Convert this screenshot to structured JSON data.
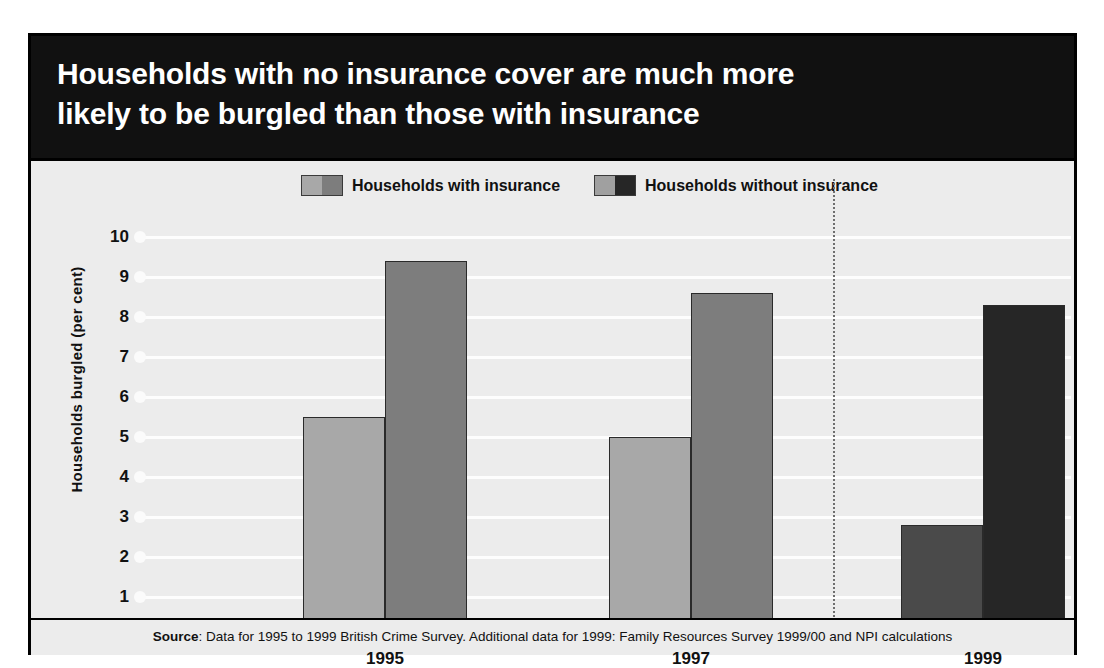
{
  "title": "Households with no insurance cover are much more\nlikely to be burgled than those with insurance",
  "legend": [
    {
      "label": "Households with insurance",
      "swatch_light": "#a8a8a8",
      "swatch_dark": "#7d7d7d"
    },
    {
      "label": "Households without insurance",
      "swatch_light": "#a0a0a0",
      "swatch_dark": "#262626"
    }
  ],
  "source": {
    "prefix": "Source",
    "text": ": Data for 1995 to 1999 British Crime Survey. Additional data for 1999: Family Resources Survey 1999/00 and NPI calculations"
  },
  "colors": {
    "banner": "#111111",
    "panel": "#ececec",
    "bar_with_insurance": "#a8a8a8",
    "bar_without_insurance": "#7d7d7d",
    "bar_with_insurance_1999": "#4a4a4a",
    "bar_without_insurance_1999": "#262626",
    "gridline": "#fdfdfd",
    "frame": "#000000"
  },
  "chart_data": {
    "type": "bar",
    "title": "Households with no insurance cover are much more likely to be burgled than those with insurance",
    "xlabel": "",
    "ylabel": "Households burgled (per cent)",
    "ylim": [
      0,
      10
    ],
    "ytick_labels": [
      "10",
      "9",
      "8",
      "7",
      "6",
      "5",
      "4",
      "3",
      "2",
      "1",
      "0"
    ],
    "yticks": [
      10,
      9,
      8,
      7,
      6,
      5,
      4,
      3,
      2,
      1,
      0
    ],
    "grid": true,
    "legend_position": "top-center",
    "categories": [
      "1995",
      "1997",
      "1999"
    ],
    "series": [
      {
        "name": "Households with insurance",
        "values": [
          5.5,
          5.0,
          2.8
        ],
        "colors": [
          "#a8a8a8",
          "#a8a8a8",
          "#4a4a4a"
        ]
      },
      {
        "name": "Households without insurance",
        "values": [
          9.4,
          8.6,
          8.3
        ],
        "colors": [
          "#7d7d7d",
          "#7d7d7d",
          "#262626"
        ]
      }
    ],
    "annotations": [
      {
        "type": "vertical-dotted-divider",
        "between": [
          "1997",
          "1999"
        ]
      }
    ]
  }
}
